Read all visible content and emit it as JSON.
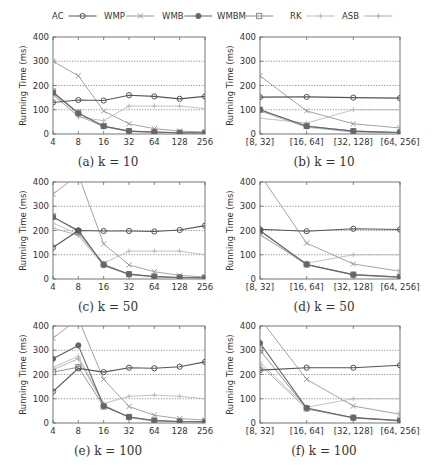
{
  "legend": {
    "entries": [
      {
        "name": "AC",
        "marker": "circle",
        "color": "#555555"
      },
      {
        "name": "WMP",
        "marker": "x",
        "color": "#999999"
      },
      {
        "name": "WMB",
        "marker": "filled-circle",
        "color": "#666666"
      },
      {
        "name": "WMBM",
        "marker": "square",
        "color": "#888888"
      },
      {
        "name": "RK",
        "marker": "plus",
        "color": "#bbbbbb"
      },
      {
        "name": "ASB",
        "marker": "plus",
        "color": "#aaaaaa"
      }
    ]
  },
  "chart_data": [
    {
      "id": "a",
      "type": "line",
      "caption": "(a) k = 10",
      "title": "",
      "xlabel": "",
      "ylabel": "Running Time (ms)",
      "ylim": [
        0,
        400
      ],
      "yticks": [
        0,
        100,
        200,
        300,
        400
      ],
      "grid": true,
      "categories": [
        "4",
        "8",
        "16",
        "32",
        "64",
        "128",
        "256"
      ],
      "series": [
        {
          "name": "AC",
          "values": [
            130,
            140,
            138,
            160,
            155,
            145,
            155
          ]
        },
        {
          "name": "WMP",
          "values": [
            300,
            240,
            95,
            42,
            22,
            12,
            8
          ]
        },
        {
          "name": "WMB",
          "values": [
            170,
            85,
            32,
            12,
            8,
            5,
            5
          ]
        },
        {
          "name": "WMBM",
          "values": [
            175,
            88,
            33,
            12,
            8,
            5,
            5
          ]
        },
        {
          "name": "RK",
          "values": [
            165,
            70,
            55,
            115,
            115,
            115,
            105
          ]
        },
        {
          "name": "ASB",
          "values": [
            160,
            75,
            30,
            10,
            6,
            4,
            3
          ]
        }
      ]
    },
    {
      "id": "b",
      "type": "line",
      "caption": "(b) k = 10",
      "title": "",
      "xlabel": "",
      "ylabel": "Running Time (ms)",
      "ylim": [
        0,
        400
      ],
      "yticks": [
        0,
        100,
        200,
        300,
        400
      ],
      "grid": true,
      "categories": [
        "[8, 32]",
        "[16, 64]",
        "[32, 128]",
        "[64, 256]"
      ],
      "series": [
        {
          "name": "AC",
          "values": [
            152,
            153,
            150,
            148
          ]
        },
        {
          "name": "WMP",
          "values": [
            240,
            95,
            42,
            25
          ]
        },
        {
          "name": "WMB",
          "values": [
            100,
            32,
            12,
            6
          ]
        },
        {
          "name": "WMBM",
          "values": [
            100,
            33,
            12,
            6
          ]
        },
        {
          "name": "RK",
          "values": [
            65,
            45,
            100,
            100
          ]
        },
        {
          "name": "ASB",
          "values": [
            95,
            28,
            8,
            4
          ]
        }
      ]
    },
    {
      "id": "c",
      "type": "line",
      "caption": "(c) k = 50",
      "title": "",
      "xlabel": "",
      "ylabel": "Running Time (ms)",
      "ylim": [
        0,
        400
      ],
      "yticks": [
        0,
        100,
        200,
        300,
        400
      ],
      "grid": true,
      "categories": [
        "4",
        "8",
        "16",
        "32",
        "64",
        "128",
        "256"
      ],
      "series": [
        {
          "name": "AC",
          "values": [
            130,
            200,
            198,
            198,
            196,
            202,
            220
          ]
        },
        {
          "name": "WMP",
          "values": [
            350,
            800,
            145,
            58,
            30,
            15,
            8
          ]
        },
        {
          "name": "WMB",
          "values": [
            255,
            200,
            58,
            20,
            10,
            6,
            5
          ]
        },
        {
          "name": "WMBM",
          "values": [
            258,
            195,
            60,
            20,
            10,
            6,
            5
          ]
        },
        {
          "name": "RK",
          "values": [
            230,
            185,
            65,
            115,
            115,
            115,
            100
          ]
        },
        {
          "name": "ASB",
          "values": [
            210,
            180,
            55,
            18,
            8,
            5,
            4
          ]
        }
      ]
    },
    {
      "id": "d",
      "type": "line",
      "caption": "(d) k = 50",
      "title": "",
      "xlabel": "",
      "ylabel": "Running Time (ms)",
      "ylim": [
        0,
        400
      ],
      "yticks": [
        0,
        100,
        200,
        300,
        400
      ],
      "grid": true,
      "categories": [
        "[8, 32]",
        "[16, 64]",
        "[32, 128]",
        "[64, 256]"
      ],
      "series": [
        {
          "name": "AC",
          "values": [
            205,
            197,
            207,
            204
          ]
        },
        {
          "name": "WMP",
          "values": [
            800,
            148,
            62,
            32
          ]
        },
        {
          "name": "WMB",
          "values": [
            200,
            60,
            18,
            8
          ]
        },
        {
          "name": "WMBM",
          "values": [
            198,
            60,
            18,
            8
          ]
        },
        {
          "name": "RK",
          "values": [
            180,
            65,
            100,
            100
          ]
        },
        {
          "name": "ASB",
          "values": [
            185,
            58,
            16,
            6
          ]
        }
      ]
    },
    {
      "id": "e",
      "type": "line",
      "caption": "(e) k = 100",
      "title": "",
      "xlabel": "",
      "ylabel": "Running Time (ms)",
      "ylim": [
        0,
        400
      ],
      "yticks": [
        0,
        100,
        200,
        300,
        400
      ],
      "grid": true,
      "categories": [
        "4",
        "8",
        "16",
        "32",
        "64",
        "128",
        "256"
      ],
      "series": [
        {
          "name": "AC",
          "values": [
            130,
            225,
            210,
            228,
            226,
            232,
            252
          ]
        },
        {
          "name": "WMP",
          "values": [
            350,
            800,
            180,
            68,
            32,
            18,
            12
          ]
        },
        {
          "name": "WMB",
          "values": [
            265,
            320,
            70,
            25,
            10,
            6,
            5
          ]
        },
        {
          "name": "WMBM",
          "values": [
            210,
            230,
            68,
            25,
            10,
            6,
            5
          ]
        },
        {
          "name": "RK",
          "values": [
            230,
            275,
            80,
            110,
            115,
            110,
            100
          ]
        },
        {
          "name": "ASB",
          "values": [
            220,
            265,
            75,
            22,
            8,
            5,
            4
          ]
        }
      ]
    },
    {
      "id": "f",
      "type": "line",
      "caption": "(f) k = 100",
      "title": "",
      "xlabel": "",
      "ylabel": "Running Time (ms)",
      "ylim": [
        0,
        400
      ],
      "yticks": [
        0,
        100,
        200,
        300,
        400
      ],
      "grid": true,
      "categories": [
        "[8, 32]",
        "[16, 64]",
        "[32, 128]",
        "[64, 256]"
      ],
      "series": [
        {
          "name": "AC",
          "values": [
            218,
            228,
            228,
            238
          ]
        },
        {
          "name": "WMP",
          "values": [
            800,
            180,
            70,
            36
          ]
        },
        {
          "name": "WMB",
          "values": [
            330,
            62,
            22,
            10
          ]
        },
        {
          "name": "WMBM",
          "values": [
            300,
            60,
            22,
            10
          ]
        },
        {
          "name": "RK",
          "values": [
            250,
            65,
            100,
            100
          ]
        },
        {
          "name": "ASB",
          "values": [
            240,
            58,
            20,
            8
          ]
        }
      ]
    }
  ]
}
